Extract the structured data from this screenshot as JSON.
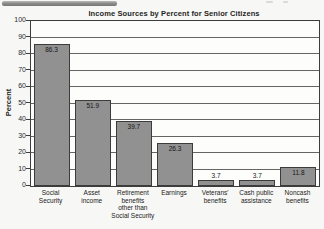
{
  "page": {
    "background_color": "#f7f7f5",
    "scan_artifact_bar_color": "#8d8d8d"
  },
  "chart_data": {
    "type": "bar",
    "title": "Income Sources by Percent for Senior Citizens",
    "xlabel": "",
    "ylabel": "Percent",
    "ylim": [
      0,
      100
    ],
    "ytick_step": 10,
    "grid": true,
    "legend_position": "none",
    "categories": [
      "Social\nSecurity",
      "Asset\nincome",
      "Retirement\nbenefits\nother than\nSocial Security",
      "Earnings",
      "Veterans'\nbenefits",
      "Cash public\nassistance",
      "Noncash\nbenefits"
    ],
    "values": [
      86.3,
      51.9,
      39.7,
      26.3,
      3.7,
      3.7,
      11.8
    ],
    "value_labels": [
      "86.3",
      "51.9",
      "39.7",
      "26.3",
      "3.7",
      "3.7",
      "11.8"
    ],
    "bar_color": "#919191",
    "bar_border_color": "#3c3c3c",
    "grid_color": "#4a4a4a"
  }
}
